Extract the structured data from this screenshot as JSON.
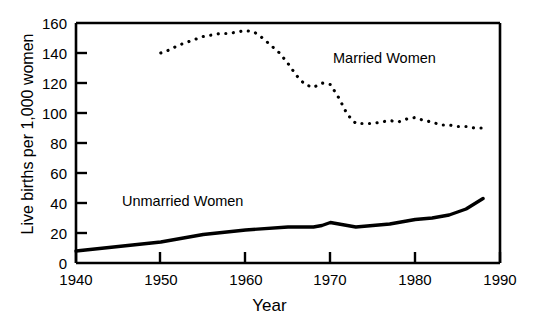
{
  "chart_data": {
    "type": "line",
    "title": "",
    "xlabel": "Year",
    "ylabel": "Live births per 1,000 women",
    "xlim": [
      1940,
      1990
    ],
    "ylim": [
      0,
      160
    ],
    "xticks": [
      1940,
      1950,
      1960,
      1970,
      1980,
      1990
    ],
    "yticks": [
      0,
      20,
      40,
      60,
      80,
      100,
      120,
      140,
      160
    ],
    "grid": false,
    "legend_position": "inline-annotations",
    "series": [
      {
        "name": "Married Women",
        "style": "dotted",
        "color": "#000000",
        "annotation": "Married Women",
        "x": [
          1950,
          1951,
          1952,
          1953,
          1954,
          1955,
          1956,
          1957,
          1958,
          1959,
          1960,
          1961,
          1962,
          1963,
          1964,
          1965,
          1966,
          1967,
          1968,
          1969,
          1970,
          1971,
          1972,
          1973,
          1974,
          1975,
          1976,
          1977,
          1978,
          1979,
          1980,
          1981,
          1982,
          1983,
          1984,
          1985,
          1986,
          1987,
          1988
        ],
        "values": [
          140,
          142,
          145,
          147,
          149,
          151,
          152,
          153,
          153,
          154,
          155,
          154,
          150,
          145,
          140,
          133,
          125,
          119,
          117,
          120,
          119,
          110,
          99,
          93,
          93,
          93,
          94,
          95,
          94,
          96,
          97,
          95,
          94,
          92,
          92,
          91,
          91,
          90,
          90
        ]
      },
      {
        "name": "Unmarried Women",
        "style": "solid",
        "color": "#000000",
        "annotation": "Unmarried Women",
        "x": [
          1940,
          1945,
          1950,
          1955,
          1960,
          1965,
          1968,
          1969,
          1970,
          1971,
          1972,
          1973,
          1975,
          1977,
          1979,
          1980,
          1982,
          1984,
          1986,
          1988
        ],
        "values": [
          8,
          11,
          14,
          19,
          22,
          24,
          24,
          25,
          27,
          26,
          25,
          24,
          25,
          26,
          28,
          29,
          30,
          32,
          36,
          43
        ]
      }
    ]
  },
  "axis": {
    "x_tick_labels": [
      "1940",
      "1950",
      "1960",
      "1970",
      "1980",
      "1990"
    ],
    "y_tick_labels": [
      "0",
      "20",
      "40",
      "60",
      "80",
      "100",
      "120",
      "140",
      "160"
    ],
    "x_title": "Year",
    "y_title": "Live births per 1,000 women"
  },
  "annotations": {
    "married": "Married Women",
    "unmarried": "Unmarried Women"
  },
  "colors": {
    "axis": "#000000",
    "line": "#000000",
    "background": "#ffffff"
  }
}
